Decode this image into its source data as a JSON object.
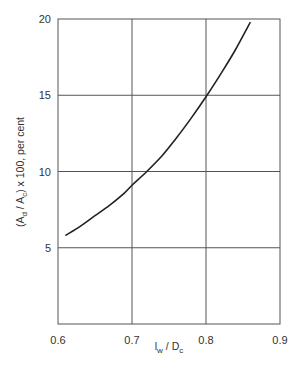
{
  "chart_data": {
    "type": "line",
    "title": "",
    "xlabel": "l_w / D_c",
    "ylabel": "(A_d / A_c) x 100, per cent",
    "xlabel_parts": {
      "l": "l",
      "l_sub": "w",
      "mid": " / D",
      "d_sub": "c"
    },
    "ylabel_parts": {
      "p1": "(A",
      "s1": "d",
      "p2": " / A",
      "s2": "c",
      "p3": ") x 100, per cent"
    },
    "xlim": [
      0.6,
      0.9
    ],
    "ylim": [
      0,
      20
    ],
    "x_ticks": [
      "0.6",
      "0.7",
      "0.8",
      "0.9"
    ],
    "y_ticks": [
      "5",
      "10",
      "15",
      "20"
    ],
    "grid": true,
    "legend": null,
    "series": [
      {
        "name": "Downcomer area vs weir length",
        "x": [
          0.61,
          0.63,
          0.65,
          0.67,
          0.69,
          0.7,
          0.72,
          0.74,
          0.76,
          0.78,
          0.8,
          0.82,
          0.84,
          0.86
        ],
        "y": [
          5.8,
          6.4,
          7.1,
          7.8,
          8.6,
          9.1,
          10.0,
          11.0,
          12.2,
          13.5,
          14.9,
          16.4,
          18.0,
          19.8
        ]
      }
    ]
  },
  "colors": {
    "axis": "#555555",
    "grid": "#555555",
    "curve": "#222222",
    "text": "#333333"
  }
}
